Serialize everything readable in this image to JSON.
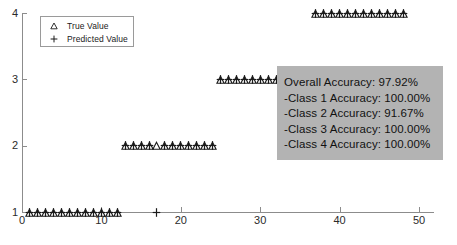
{
  "chart_data": {
    "type": "scatter",
    "title": "",
    "xlabel": "",
    "ylabel": "",
    "xlim": [
      0,
      50
    ],
    "ylim": [
      1,
      4
    ],
    "xticks": [
      0,
      10,
      20,
      30,
      40,
      50
    ],
    "yticks": [
      1,
      2,
      3,
      4
    ],
    "grid": false,
    "legend_position": "top-left",
    "legend": [
      {
        "marker": "triangle-up-open",
        "label": "True Value"
      },
      {
        "marker": "plus",
        "label": "Predicted Value"
      }
    ],
    "series": [
      {
        "name": "True Value",
        "marker": "triangle-up-open",
        "x": [
          1,
          2,
          3,
          4,
          5,
          6,
          7,
          8,
          9,
          10,
          11,
          12,
          13,
          14,
          15,
          16,
          17,
          18,
          19,
          20,
          21,
          22,
          23,
          24,
          25,
          26,
          27,
          28,
          29,
          30,
          31,
          32,
          33,
          34,
          35,
          36,
          37,
          38,
          39,
          40,
          41,
          42,
          43,
          44,
          45,
          46,
          47,
          48
        ],
        "y": [
          1,
          1,
          1,
          1,
          1,
          1,
          1,
          1,
          1,
          1,
          1,
          1,
          2,
          2,
          2,
          2,
          2,
          2,
          2,
          2,
          2,
          2,
          2,
          2,
          3,
          3,
          3,
          3,
          3,
          3,
          3,
          3,
          3,
          3,
          3,
          3,
          4,
          4,
          4,
          4,
          4,
          4,
          4,
          4,
          4,
          4,
          4,
          4
        ]
      },
      {
        "name": "Predicted Value",
        "marker": "plus",
        "x": [
          1,
          2,
          3,
          4,
          5,
          6,
          7,
          8,
          9,
          10,
          11,
          12,
          13,
          14,
          15,
          16,
          17,
          18,
          19,
          20,
          21,
          22,
          23,
          24,
          25,
          26,
          27,
          28,
          29,
          30,
          31,
          32,
          33,
          34,
          35,
          36,
          37,
          38,
          39,
          40,
          41,
          42,
          43,
          44,
          45,
          46,
          47,
          48
        ],
        "y": [
          1,
          1,
          1,
          1,
          1,
          1,
          1,
          1,
          1,
          1,
          1,
          1,
          2,
          2,
          2,
          2,
          1,
          2,
          2,
          2,
          2,
          2,
          2,
          2,
          3,
          3,
          3,
          3,
          3,
          3,
          3,
          3,
          3,
          3,
          3,
          3,
          4,
          4,
          4,
          4,
          4,
          4,
          4,
          4,
          4,
          4,
          4,
          4
        ]
      }
    ],
    "annotations": {
      "accuracy_box": {
        "background_color": "#b3b3b3",
        "lines": [
          "Overall Accuracy: 97.92%",
          "-Class 1 Accuracy: 100.00%",
          "-Class 2 Accuracy: 91.67%",
          "-Class 3 Accuracy: 100.00%",
          "-Class 4 Accuracy: 100.00%"
        ]
      }
    }
  },
  "colors": {
    "marker": "#1a1a1a",
    "axis": "#8c8c8c",
    "accuracy_background": "#b3b3b3",
    "text": "#1a1a1a"
  }
}
